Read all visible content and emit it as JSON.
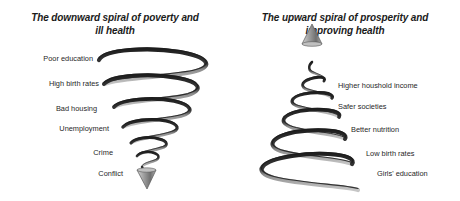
{
  "figure": {
    "background_color": "#ffffff",
    "panels": [
      {
        "id": "downward",
        "title_line1": "The downward spiral of poverty and",
        "title_line2": "ill health",
        "arrow_direction": "down",
        "spiral_shape": "cone-narrowing-downward",
        "labels": [
          {
            "text": "Poor education",
            "x": 93,
            "y": 58
          },
          {
            "text": "High birth rates",
            "x": 99,
            "y": 83
          },
          {
            "text": "Bad housing",
            "x": 97,
            "y": 108
          },
          {
            "text": "Unemployment",
            "x": 109,
            "y": 128
          },
          {
            "text": "Crime",
            "x": 113,
            "y": 152
          },
          {
            "text": "Conflict",
            "x": 123,
            "y": 173
          }
        ]
      },
      {
        "id": "upward",
        "title_line1": "The upward spiral of prosperity and",
        "title_line2": "improving health",
        "arrow_direction": "up",
        "spiral_shape": "cone-widening-downward",
        "labels": [
          {
            "text": "Higher houshold income",
            "x": 338,
            "y": 85
          },
          {
            "text": "Safer societies",
            "x": 338,
            "y": 106
          },
          {
            "text": "Better nutrition",
            "x": 351,
            "y": 129
          },
          {
            "text": "Low birth rates",
            "x": 366,
            "y": 153
          },
          {
            "text": "Girls' education",
            "x": 377,
            "y": 173
          }
        ]
      }
    ],
    "colors": {
      "coil_dark": "#2b2b2b",
      "coil_light": "#b4b4b4",
      "coil_mid": "#6e6e6e",
      "arrow_fill": "#9a9a9a",
      "arrow_stroke": "#4a4a4a",
      "text": "#1f1f1f",
      "title_text": "#1b1b1b"
    }
  }
}
